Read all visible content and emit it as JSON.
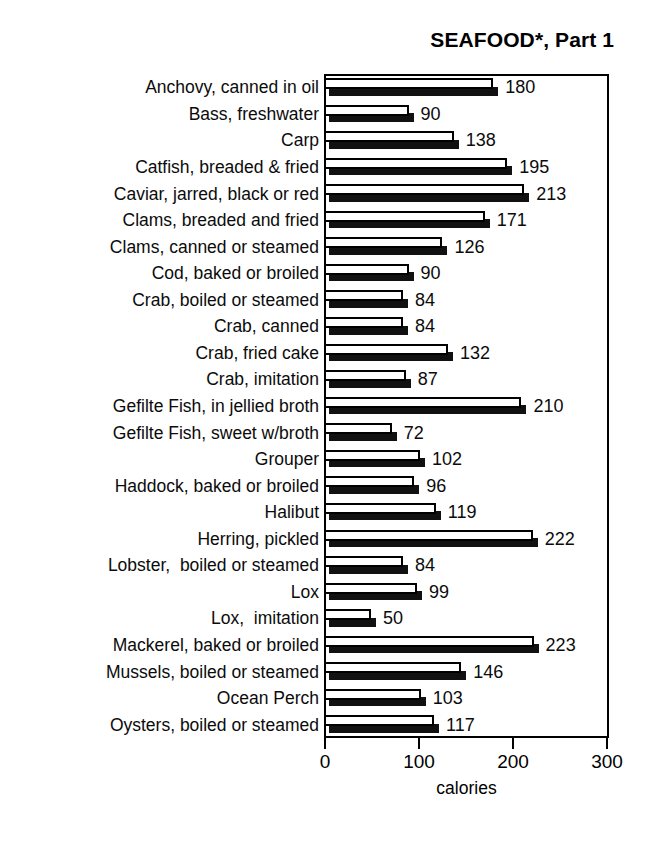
{
  "chart_data": {
    "type": "bar",
    "orientation": "horizontal",
    "title": "SEAFOOD*, Part 1",
    "xlabel": "calories",
    "ylabel": "",
    "xlim": [
      0,
      300
    ],
    "xticks": [
      0,
      100,
      200,
      300
    ],
    "xtick_labels": [
      "0",
      "100",
      "200",
      "300"
    ],
    "grid": false,
    "legend": null,
    "show_value_labels": true,
    "categories": [
      "Anchovy, canned in oil",
      "Bass, freshwater",
      "Carp",
      "Catfish, breaded & fried",
      "Caviar, jarred, black or red",
      "Clams, breaded and fried",
      "Clams, canned or steamed",
      "Cod, baked or broiled",
      "Crab, boiled or steamed",
      "Crab, canned",
      "Crab, fried cake",
      "Crab, imitation",
      "Gefilte Fish, in jellied broth",
      "Gefilte Fish, sweet w/broth",
      "Grouper",
      "Haddock, baked or broiled",
      "Halibut",
      "Herring, pickled",
      "Lobster,  boiled or steamed",
      "Lox",
      "Lox,  imitation",
      "Mackerel, baked or broiled",
      "Mussels, boiled or steamed",
      "Ocean Perch",
      "Oysters, boiled or steamed"
    ],
    "values": [
      180,
      90,
      138,
      195,
      213,
      171,
      126,
      90,
      84,
      84,
      132,
      87,
      210,
      72,
      102,
      96,
      119,
      222,
      84,
      99,
      50,
      223,
      146,
      103,
      117
    ],
    "value_labels": [
      "180",
      "90",
      "138",
      "195",
      "213",
      "171",
      "126",
      "90",
      "84",
      "84",
      "132",
      "87",
      "210",
      "72",
      "102",
      "96",
      "119",
      "222",
      "84",
      "99",
      "50",
      "223",
      "146",
      "103",
      "117"
    ],
    "style": {
      "bar_face_color": "#ffffff",
      "bar_edge_color": "#000000",
      "bar_shadow_color": "#111111",
      "frame_color": "#000000",
      "background": "#ffffff",
      "text_color": "#000000"
    }
  }
}
